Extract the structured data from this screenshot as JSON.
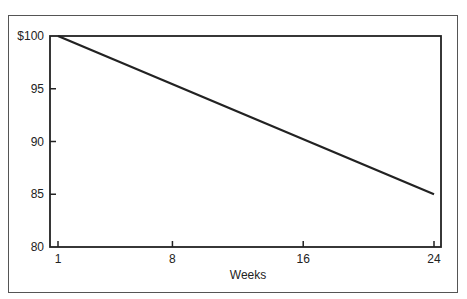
{
  "chart_data": {
    "type": "line",
    "title": "",
    "xlabel": "Weeks",
    "ylabel": "",
    "x": [
      1,
      24
    ],
    "series": [
      {
        "name": "Value",
        "values": [
          100,
          85
        ]
      }
    ],
    "xticks": [
      1,
      8,
      16,
      24
    ],
    "xtick_labels": [
      "1",
      "8",
      "16",
      "24"
    ],
    "yticks": [
      80,
      85,
      90,
      95,
      100
    ],
    "ytick_labels": [
      "80",
      "85",
      "90",
      "95",
      "$100"
    ],
    "xlim": [
      1,
      24
    ],
    "ylim": [
      80,
      100
    ],
    "grid": false,
    "legend": "none"
  }
}
